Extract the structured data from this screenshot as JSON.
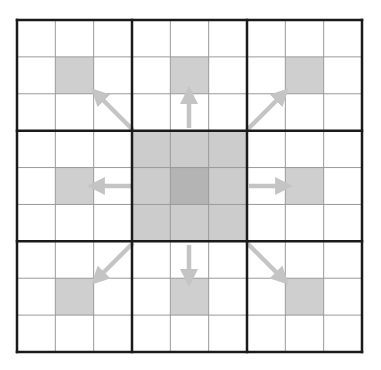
{
  "diagram": {
    "grid": {
      "rows": 9,
      "cols": 9,
      "block_size": 3,
      "origin_x": 17,
      "origin_y": 20,
      "width": 345,
      "height": 332
    },
    "colors": {
      "background": "#ffffff",
      "thin_line": "#9a9a9a",
      "thick_line": "#1a1a1a",
      "highlight_cell": "#cfcfcf",
      "center_block": "#cccccc",
      "center_cell": "#b4b4b4",
      "arrow": "#c4c4c4"
    },
    "highlighted_cells": [
      {
        "row": 1,
        "col": 1
      },
      {
        "row": 1,
        "col": 4
      },
      {
        "row": 1,
        "col": 7
      },
      {
        "row": 4,
        "col": 1
      },
      {
        "row": 4,
        "col": 7
      },
      {
        "row": 7,
        "col": 1
      },
      {
        "row": 7,
        "col": 4
      },
      {
        "row": 7,
        "col": 7
      }
    ],
    "center_block": {
      "row_start": 3,
      "col_start": 3,
      "size": 3
    },
    "center_cell": {
      "row": 4,
      "col": 4
    },
    "arrows": [
      {
        "name": "up-left",
        "from": [
          133,
          130
        ],
        "to": [
          97,
          94
        ]
      },
      {
        "name": "up",
        "from": [
          189,
          128
        ],
        "to": [
          189,
          94
        ]
      },
      {
        "name": "up-right",
        "from": [
          247,
          130
        ],
        "to": [
          283,
          94
        ]
      },
      {
        "name": "left",
        "from": [
          131,
          186
        ],
        "to": [
          95,
          186
        ]
      },
      {
        "name": "right",
        "from": [
          249,
          186
        ],
        "to": [
          285,
          186
        ]
      },
      {
        "name": "down-left",
        "from": [
          133,
          243
        ],
        "to": [
          97,
          279
        ]
      },
      {
        "name": "down",
        "from": [
          189,
          245
        ],
        "to": [
          189,
          279
        ]
      },
      {
        "name": "down-right",
        "from": [
          247,
          243
        ],
        "to": [
          283,
          279
        ]
      }
    ]
  }
}
